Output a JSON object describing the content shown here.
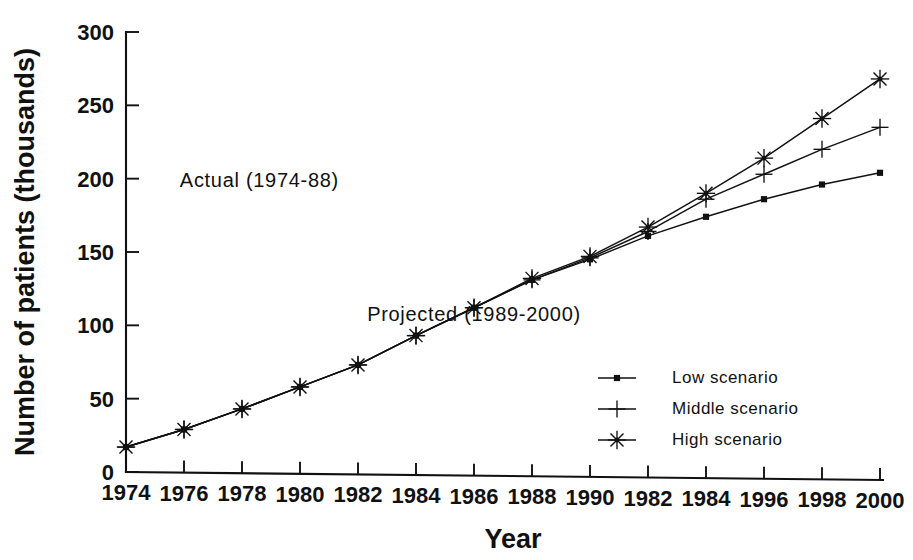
{
  "chart_data": {
    "type": "line",
    "title": "",
    "xlabel": "Year",
    "ylabel": "Number of patients (thousands)",
    "xlim": [
      1974,
      2000
    ],
    "ylim": [
      0,
      300
    ],
    "grid": false,
    "legend_position": "inside-lower-right",
    "x": [
      1974,
      1976,
      1978,
      1980,
      1982,
      1984,
      1986,
      1988,
      1990,
      1992,
      1994,
      1996,
      1998,
      2000
    ],
    "x_tick_labels": [
      "1974",
      "1976",
      "1978",
      "1980",
      "1982",
      "1984",
      "1986",
      "1988",
      "1990",
      "1982",
      "1984",
      "1996",
      "1998",
      "2000"
    ],
    "y_tick_labels": [
      "0",
      "50",
      "100",
      "150",
      "200",
      "250",
      "300"
    ],
    "y_ticks": [
      0,
      50,
      100,
      150,
      200,
      250,
      300
    ],
    "series": [
      {
        "name": "Low scenario",
        "marker": "square",
        "values": [
          17,
          29,
          43,
          58,
          73,
          93,
          112,
          131,
          145,
          161,
          174,
          186,
          196,
          204
        ]
      },
      {
        "name": "Middle scenario",
        "marker": "plus",
        "values": [
          17,
          29,
          43,
          58,
          73,
          93,
          112,
          131,
          146,
          164,
          186,
          203,
          220,
          235
        ]
      },
      {
        "name": "High scenario",
        "marker": "asterisk",
        "values": [
          17,
          29,
          43,
          58,
          73,
          93,
          112,
          132,
          147,
          167,
          190,
          214,
          241,
          268
        ]
      }
    ],
    "annotations": [
      {
        "text": "Actual (1974-88)",
        "x": 1978.6,
        "y": 194
      },
      {
        "text": "Projected (1989-2000)",
        "x": 1986.0,
        "y": 103
      }
    ],
    "colors": {
      "ink": "#111111",
      "background": "#ffffff"
    }
  },
  "legend": {
    "entries": [
      {
        "label": "Low scenario",
        "marker": "square"
      },
      {
        "label": "Middle scenario",
        "marker": "plus"
      },
      {
        "label": "High scenario",
        "marker": "asterisk"
      }
    ]
  }
}
